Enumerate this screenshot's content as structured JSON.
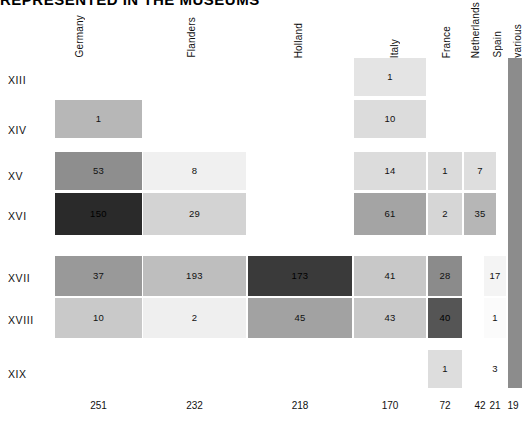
{
  "title": "REPRESENTED IN THE MUSEUMS",
  "chart_data": {
    "type": "heatmap",
    "title": "REPRESENTED IN THE MUSEUMS",
    "xlabel": "",
    "ylabel": "",
    "grid": false,
    "legend": "none",
    "columns": [
      "Germany",
      "Flanders",
      "Holland",
      "Italy",
      "France",
      "Netherlands",
      "Spain",
      "various"
    ],
    "rows": [
      "XIII",
      "XIV",
      "XV",
      "XVI",
      "XVII",
      "XVIII",
      "XIX"
    ],
    "column_totals": [
      251,
      232,
      218,
      170,
      72,
      42,
      21,
      19
    ],
    "values": [
      [
        null,
        null,
        null,
        1,
        null,
        null,
        null,
        null
      ],
      [
        1,
        null,
        null,
        10,
        null,
        null,
        null,
        null
      ],
      [
        53,
        8,
        null,
        14,
        1,
        7,
        null,
        null
      ],
      [
        150,
        29,
        null,
        61,
        2,
        35,
        null,
        null
      ],
      [
        37,
        193,
        173,
        41,
        28,
        null,
        17,
        null
      ],
      [
        10,
        2,
        45,
        43,
        40,
        null,
        1,
        null
      ],
      [
        null,
        null,
        null,
        null,
        1,
        null,
        3,
        null
      ]
    ],
    "cell_colors": [
      [
        null,
        null,
        null,
        "#e4e4e4",
        null,
        null,
        null,
        null
      ],
      [
        "#b7b7b7",
        null,
        null,
        "#dcdcdc",
        null,
        null,
        null,
        null
      ],
      [
        "#8e8e8e",
        "#f0f0f0",
        null,
        "#dcdcdc",
        "#dbdbdb",
        "#dedede",
        null,
        null
      ],
      [
        "#2a2a2a",
        "#d3d3d3",
        null,
        "#a4a4a4",
        "#d6d6d6",
        "#b6b6b6",
        null,
        null
      ],
      [
        "#999999",
        "#bebebe",
        "#3a3a3a",
        "#c8c8c8",
        "#8b8b8b",
        null,
        "#f4f4f4",
        null
      ],
      [
        "#c9c9c9",
        "#efefef",
        "#a2a2a2",
        "#c9c9c9",
        "#555555",
        null,
        "#fbfbfb",
        null
      ],
      [
        null,
        null,
        null,
        null,
        "#dddddd",
        null,
        "#ffffff",
        null
      ]
    ],
    "various_column_color": "#8c8c8c",
    "note": "Single tall bar spans all rows for the 'various' column"
  },
  "layout": {
    "columns": [
      {
        "name": "Germany",
        "x": 55,
        "width": 87,
        "total_x": 55,
        "total_width": 87
      },
      {
        "name": "Flanders",
        "x": 143,
        "width": 103,
        "total_x": 143,
        "total_width": 103
      },
      {
        "name": "Holland",
        "x": 248,
        "width": 104,
        "total_x": 248,
        "total_width": 104
      },
      {
        "name": "Italy",
        "x": 354,
        "width": 72,
        "total_x": 354,
        "total_width": 72
      },
      {
        "name": "France",
        "x": 428,
        "width": 34,
        "total_x": 428,
        "total_width": 34
      },
      {
        "name": "Netherlands",
        "x": 464,
        "width": 32,
        "total_x": 464,
        "total_width": 32
      },
      {
        "name": "Spain",
        "x": 484,
        "width": 22,
        "total_x": 484,
        "total_width": 22
      },
      {
        "name": "various",
        "x": 508,
        "width": 14,
        "total_x": 502,
        "total_width": 22
      }
    ],
    "header_x": [
      74,
      186,
      293,
      389,
      441,
      470,
      492,
      512
    ],
    "rows": [
      {
        "name": "XIII",
        "y": 58,
        "height": 38,
        "label_y": 74
      },
      {
        "name": "XIV",
        "y": 100,
        "height": 38,
        "label_y": 124
      },
      {
        "name": "XV",
        "y": 152,
        "height": 38,
        "label_y": 170
      },
      {
        "name": "XVI",
        "y": 193,
        "height": 42,
        "label_y": 210
      },
      {
        "name": "XVII",
        "y": 256,
        "height": 40,
        "label_y": 272
      },
      {
        "name": "XVIII",
        "y": 298,
        "height": 40,
        "label_y": 314
      },
      {
        "name": "XIX",
        "y": 350,
        "height": 38,
        "label_y": 368
      }
    ],
    "various_bar": {
      "x": 508,
      "y": 58,
      "width": 14,
      "height": 330
    },
    "totals_y": 400
  }
}
